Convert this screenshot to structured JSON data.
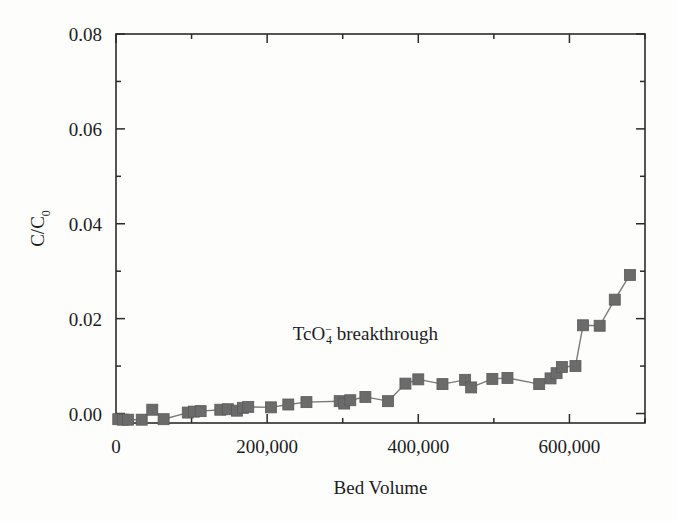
{
  "figure": {
    "background_color": "#fdfdfc",
    "frame_color": "#2b2b2b",
    "marker_color": "#6b6b6b",
    "line_color": "#7a7a7a"
  },
  "chart_data": {
    "type": "scatter",
    "title": "",
    "subtitle": "",
    "xlabel": "Bed Volume",
    "ylabel": "C/C0",
    "ylabel_display": "C/C",
    "ylabel_subscript": "0",
    "xlim": [
      0,
      700000
    ],
    "ylim": [
      -0.002,
      0.08
    ],
    "xticks": [
      0,
      200000,
      400000,
      600000
    ],
    "xtick_labels": [
      "0",
      "200,000",
      "400,000",
      "600,000"
    ],
    "yticks": [
      0.0,
      0.02,
      0.04,
      0.06,
      0.08
    ],
    "ytick_labels": [
      "0.00",
      "0.02",
      "0.04",
      "0.06",
      "0.08"
    ],
    "minor_xticks": [
      100000,
      300000,
      500000,
      700000
    ],
    "minor_yticks": [
      0.01,
      0.03,
      0.05,
      0.07
    ],
    "grid": false,
    "legend": false,
    "legend_position": "none",
    "marker": "square",
    "linestyle": "solid",
    "annotations": [
      {
        "text": "TcO4- breakthrough",
        "text_prefix": "TcO",
        "text_sub": "4",
        "text_sup": "−",
        "text_suffix": " breakthrough",
        "x": 330000,
        "y": 0.0155
      }
    ],
    "series": [
      {
        "name": "TcO4- breakthrough",
        "x": [
          3000,
          9000,
          16000,
          34000,
          48000,
          63000,
          95000,
          103000,
          112000,
          138000,
          148000,
          160000,
          168000,
          175000,
          205000,
          228000,
          252000,
          296000,
          302000,
          310000,
          330000,
          360000,
          383000,
          400000,
          432000,
          462000,
          470000,
          498000,
          518000,
          560000,
          575000,
          583000,
          590000,
          608000,
          618000,
          640000,
          660000,
          680000
        ],
        "y": [
          -0.0012,
          -0.0013,
          -0.0013,
          -0.0013,
          0.0008,
          -0.0012,
          0.0002,
          0.0004,
          0.0005,
          0.0008,
          0.0009,
          0.0006,
          0.0012,
          0.0014,
          0.0013,
          0.0019,
          0.0024,
          0.0026,
          0.0021,
          0.0028,
          0.0035,
          0.0026,
          0.0063,
          0.0072,
          0.0062,
          0.0071,
          0.0055,
          0.0073,
          0.0075,
          0.0062,
          0.0074,
          0.0085,
          0.0098,
          0.01,
          0.0186,
          0.0185,
          0.024,
          0.0292
        ]
      }
    ]
  }
}
